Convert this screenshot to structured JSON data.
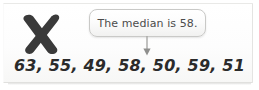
{
  "figure": {
    "kind": "annotated-math-example",
    "background_color": "#ffffff",
    "panel_color": "#fdfdfd",
    "border_color": "#e4e4e2"
  },
  "mark": {
    "name": "incorrect-x-mark",
    "symbol": "X",
    "meaning": "incorrect",
    "color": "#3a3a3a"
  },
  "callout": {
    "text": "The median is 58.",
    "text_color": "#4b4b4b",
    "border_color": "#c9c9c7",
    "fill_color": "#fcfcfc"
  },
  "pointer": {
    "name": "down-arrow",
    "direction": "down",
    "color": "#9a9a98"
  },
  "data_list": {
    "text": "63, 55, 49, 58, 50, 59, 51",
    "values": [
      63,
      55,
      49,
      58,
      50,
      59,
      51
    ],
    "separator": ", ",
    "color": "#2b2b2b"
  }
}
